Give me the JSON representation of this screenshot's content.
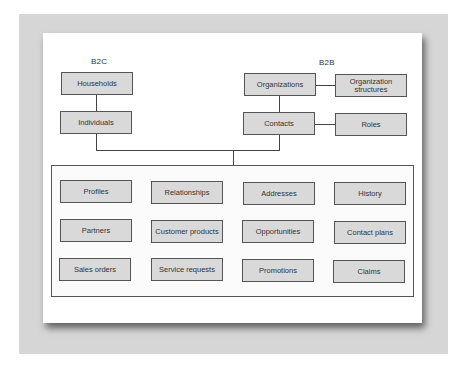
{
  "diagram": {
    "groups": {
      "b2c": {
        "label": "B2C",
        "nodes": [
          "Households",
          "Individuals"
        ]
      },
      "b2b": {
        "label": "B2B",
        "nodes": [
          "Organizations",
          "Organization structures",
          "Contacts",
          "Roles"
        ]
      }
    },
    "edges": [
      [
        "Households",
        "Individuals"
      ],
      [
        "Organizations",
        "Organization structures"
      ],
      [
        "Organizations",
        "Contacts"
      ],
      [
        "Contacts",
        "Roles"
      ],
      [
        "Individuals",
        "shared-container"
      ],
      [
        "Contacts",
        "shared-container"
      ]
    ],
    "shared": {
      "items": [
        "Profiles",
        "Relationships",
        "Addresses",
        "History",
        "Partners",
        "Customer products",
        "Opportunities",
        "Contact plans",
        "Sales orders",
        "Service requests",
        "Promotions",
        "Claims"
      ]
    }
  },
  "colors": {
    "box_fill": "#d9d9d9",
    "box_border": "#555555",
    "frame": "#d6d6d6"
  }
}
